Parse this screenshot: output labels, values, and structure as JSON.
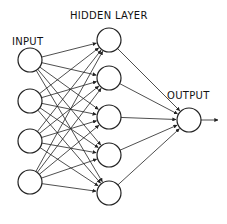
{
  "diagram": {
    "type": "neural-network",
    "labels": {
      "hidden": "HIDDEN LAYER",
      "input": "INPUT",
      "output": "OUTPUT"
    },
    "layers": {
      "input": {
        "count": 4,
        "x": 30,
        "ys": [
          60,
          101,
          141,
          182
        ]
      },
      "hidden": {
        "count": 5,
        "x": 109,
        "ys": [
          40,
          78,
          117,
          155,
          193
        ]
      },
      "output": {
        "count": 1,
        "x": 189,
        "ys": [
          120
        ]
      }
    },
    "node_radius": 12,
    "connections": "fully-connected",
    "output_arrow_end_x": 218
  }
}
